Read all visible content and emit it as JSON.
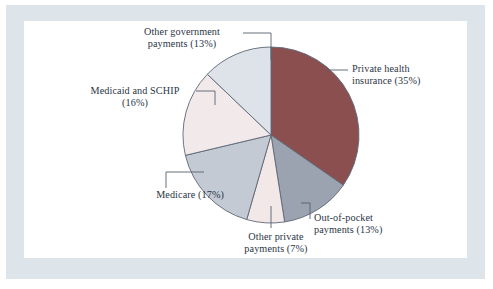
{
  "figure": {
    "background_color": "#ffffff",
    "frame_color": "#dde4ea",
    "panel_color": "#ffffff",
    "text_color": "#2a3545",
    "leader_color": "#55606e",
    "outline_color": "#5d6775"
  },
  "chart_data": {
    "type": "pie",
    "title": "",
    "subtitle": "",
    "xlabel": "",
    "ylabel": "",
    "legend_position": "none",
    "grid": false,
    "start_angle_deg": 0,
    "direction": "clockwise",
    "labels": [
      "Private health insurance (35%)",
      "Out-of-pocket payments (13%)",
      "Other private payments (7%)",
      "Medicare (17%)",
      "Medicaid and SCHIP (16%)",
      "Other government payments (13%)"
    ],
    "categories": [
      "Private health insurance",
      "Out-of-pocket payments",
      "Other private payments",
      "Medicare",
      "Medicaid and SCHIP",
      "Other government payments"
    ],
    "values": [
      35,
      13,
      7,
      17,
      16,
      13
    ],
    "colors": [
      "#8b4f4f",
      "#9ba3b0",
      "#f3e8e8",
      "#c3cad4",
      "#f2eaea",
      "#dde3e8"
    ]
  },
  "labels": {
    "other_government": {
      "line1": "Other government",
      "line2": "payments (13%)"
    },
    "private_health": {
      "line1": "Private health",
      "line2": "insurance (35%)"
    },
    "medicaid_schip": {
      "line1": "Medicaid and SCHIP",
      "line2": "(16%)"
    },
    "medicare": {
      "line1": "Medicare (17%)",
      "line2": ""
    },
    "other_private": {
      "line1": "Other private",
      "line2": "payments (7%)"
    },
    "out_of_pocket": {
      "line1": "Out-of-pocket",
      "line2": "payments (13%)"
    }
  }
}
